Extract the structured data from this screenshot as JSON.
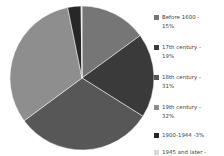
{
  "chart_data": {
    "type": "pie",
    "title": "",
    "subtitle": "",
    "xlabel": "",
    "ylabel": "",
    "grid": false,
    "legend_position": "right",
    "start_angle_deg": 0,
    "direction": "clockwise",
    "categories": [
      "Before 1600",
      "17th century",
      "18th century",
      "19th century",
      "1900-1944",
      "1945 and later"
    ],
    "values": [
      15,
      19,
      31,
      32,
      3,
      0.2
    ],
    "value_unit": "%",
    "colors": [
      "#767676",
      "#3a3a3a",
      "#575757",
      "#8e8e8e",
      "#272727",
      "#d8d8d8"
    ],
    "slices": [
      {
        "label": "Before 1600",
        "value": 15,
        "display": "15%",
        "color": "#767676"
      },
      {
        "label": "17th century",
        "value": 19,
        "display": "19%",
        "color": "#3a3a3a"
      },
      {
        "label": "18th century",
        "value": 31,
        "display": "31%",
        "color": "#575757"
      },
      {
        "label": "19th century",
        "value": 32,
        "display": "32%",
        "color": "#8e8e8e"
      },
      {
        "label": "1900-1944",
        "value": 3,
        "display": "3%",
        "color": "#272727"
      },
      {
        "label": "1945 and later",
        "value": 0.2,
        "display": "0.2%",
        "color": "#d8d8d8"
      }
    ]
  },
  "legend": {
    "entries": [
      {
        "text": "Before 1600 -\n15%",
        "swatch": "#767676",
        "swatch_name": "legend-swatch-before-1600"
      },
      {
        "text": "17th century -\n19%",
        "swatch": "#3a3a3a",
        "swatch_name": "legend-swatch-17th-century"
      },
      {
        "text": "18th century -\n31%",
        "swatch": "#575757",
        "swatch_name": "legend-swatch-18th-century"
      },
      {
        "text": "19th century -\n32%",
        "swatch": "#8e8e8e",
        "swatch_name": "legend-swatch-19th-century"
      },
      {
        "text": "1900-1944 -3%",
        "swatch": "#272727",
        "swatch_name": "legend-swatch-1900-1944"
      },
      {
        "text": "1945 and later -\n0.2%",
        "swatch": "#d8d8d8",
        "swatch_name": "legend-swatch-1945-and-later"
      }
    ],
    "tops": [
      8,
      38,
      68,
      98,
      126,
      143
    ]
  },
  "canvas": {
    "background": "#ffffff",
    "pie_center_x": 74,
    "pie_center_y": 75,
    "pie_radius": 72
  }
}
